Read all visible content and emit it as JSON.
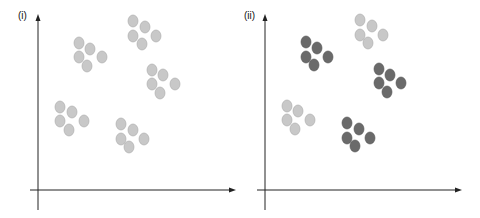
{
  "colors": {
    "light": "#c8c8c8",
    "light_stroke": "#a8a8a8",
    "dark": "#6a6a6a",
    "dark_stroke": "#505050",
    "axis": "#222222"
  },
  "panels": [
    {
      "label": "(i)",
      "clusters": [
        {
          "shade": "light",
          "points": [
            [
              41,
              43
            ],
            [
              52,
              49
            ],
            [
              41,
              57
            ],
            [
              49,
              66
            ],
            [
              64,
              57
            ]
          ]
        },
        {
          "shade": "light",
          "points": [
            [
              95,
              21
            ],
            [
              107,
              27
            ],
            [
              95,
              36
            ],
            [
              104,
              44
            ],
            [
              118,
              36
            ]
          ]
        },
        {
          "shade": "light",
          "points": [
            [
              114,
              70
            ],
            [
              125,
              75
            ],
            [
              114,
              84
            ],
            [
              122,
              93
            ],
            [
              137,
              84
            ]
          ]
        },
        {
          "shade": "light",
          "points": [
            [
              22,
              107
            ],
            [
              34,
              112
            ],
            [
              22,
              121
            ],
            [
              31,
              130
            ],
            [
              46,
              121
            ]
          ]
        },
        {
          "shade": "light",
          "points": [
            [
              83,
              124
            ],
            [
              95,
              130
            ],
            [
              83,
              139
            ],
            [
              91,
              147
            ],
            [
              106,
              139
            ]
          ]
        }
      ]
    },
    {
      "label": "(ii)",
      "clusters": [
        {
          "shade": "dark",
          "points": [
            [
              41,
              42
            ],
            [
              52,
              48
            ],
            [
              41,
              57
            ],
            [
              49,
              65
            ],
            [
              63,
              57
            ]
          ]
        },
        {
          "shade": "light",
          "points": [
            [
              95,
              20
            ],
            [
              107,
              26
            ],
            [
              95,
              35
            ],
            [
              103,
              43
            ],
            [
              118,
              35
            ]
          ]
        },
        {
          "shade": "dark",
          "points": [
            [
              114,
              69
            ],
            [
              125,
              75
            ],
            [
              114,
              83
            ],
            [
              122,
              92
            ],
            [
              136,
              83
            ]
          ]
        },
        {
          "shade": "light",
          "points": [
            [
              22,
              106
            ],
            [
              33,
              111
            ],
            [
              22,
              120
            ],
            [
              30,
              129
            ],
            [
              45,
              120
            ]
          ]
        },
        {
          "shade": "dark",
          "points": [
            [
              82,
              123
            ],
            [
              94,
              129
            ],
            [
              82,
              138
            ],
            [
              90,
              146
            ],
            [
              105,
              138
            ]
          ]
        }
      ]
    }
  ]
}
